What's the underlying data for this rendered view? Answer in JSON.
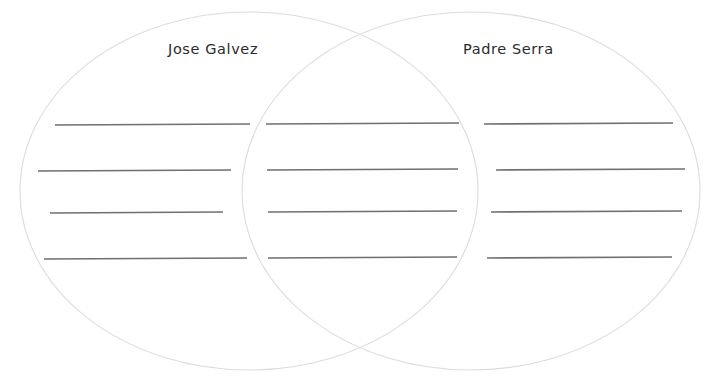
{
  "worksheet": {
    "type": "venn-diagram",
    "width": 721,
    "height": 387,
    "background_color": "#ffffff",
    "circle_stroke_color": "#dcdcdf",
    "line_color": "#6f6f74",
    "label_color": "#2b2b2d",
    "scan_artifact_text": "..... ........ ..... ........ ..... ........ ....."
  },
  "venn": {
    "left_circle": {
      "label": "Jose Galvez",
      "cx": 249,
      "cy": 191,
      "rx": 229,
      "ry": 179
    },
    "right_circle": {
      "label": "Padre Serra",
      "cx": 471,
      "cy": 191,
      "rx": 229,
      "ry": 179
    },
    "regions": [
      {
        "name": "left-only",
        "label": "Jose Galvez",
        "line_count": 4,
        "lines": [
          {
            "x1": 55,
            "y1": 125,
            "x2": 250,
            "y2": 124
          },
          {
            "x1": 38,
            "y1": 171,
            "x2": 231,
            "y2": 170
          },
          {
            "x1": 50,
            "y1": 213,
            "x2": 223,
            "y2": 212
          },
          {
            "x1": 44,
            "y1": 259,
            "x2": 247,
            "y2": 258
          }
        ]
      },
      {
        "name": "intersection",
        "label": "",
        "line_count": 4,
        "lines": [
          {
            "x1": 266,
            "y1": 124,
            "x2": 459,
            "y2": 123
          },
          {
            "x1": 267,
            "y1": 170,
            "x2": 458,
            "y2": 169
          },
          {
            "x1": 268,
            "y1": 212,
            "x2": 457,
            "y2": 211
          },
          {
            "x1": 268,
            "y1": 258,
            "x2": 457,
            "y2": 257
          }
        ]
      },
      {
        "name": "right-only",
        "label": "Padre Serra",
        "line_count": 4,
        "lines": [
          {
            "x1": 484,
            "y1": 124,
            "x2": 673,
            "y2": 123
          },
          {
            "x1": 496,
            "y1": 170,
            "x2": 685,
            "y2": 169
          },
          {
            "x1": 491,
            "y1": 212,
            "x2": 682,
            "y2": 211
          },
          {
            "x1": 487,
            "y1": 258,
            "x2": 672,
            "y2": 257
          }
        ]
      }
    ]
  }
}
